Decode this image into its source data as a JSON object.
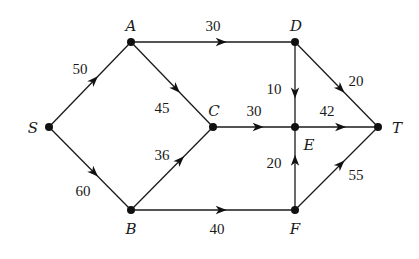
{
  "colors": {
    "ink": "#1a1a1a",
    "background": "#ffffff"
  },
  "nodes": [
    {
      "id": "S",
      "label": "S",
      "x": 49,
      "y": 127,
      "lx": 33,
      "ly": 133,
      "anchor": "middle"
    },
    {
      "id": "A",
      "label": "A",
      "x": 131,
      "y": 42,
      "lx": 131,
      "ly": 31,
      "anchor": "middle"
    },
    {
      "id": "B",
      "label": "B",
      "x": 131,
      "y": 210,
      "lx": 131,
      "ly": 234,
      "anchor": "middle"
    },
    {
      "id": "C",
      "label": "C",
      "x": 213,
      "y": 127,
      "lx": 214,
      "ly": 116,
      "anchor": "middle"
    },
    {
      "id": "D",
      "label": "D",
      "x": 295,
      "y": 42,
      "lx": 296,
      "ly": 31,
      "anchor": "middle"
    },
    {
      "id": "E",
      "label": "E",
      "x": 295,
      "y": 127,
      "lx": 309,
      "ly": 150,
      "anchor": "middle"
    },
    {
      "id": "F",
      "label": "F",
      "x": 295,
      "y": 210,
      "lx": 295,
      "ly": 234,
      "anchor": "middle"
    },
    {
      "id": "T",
      "label": "T",
      "x": 378,
      "y": 127,
      "lx": 397,
      "ly": 133,
      "anchor": "middle"
    }
  ],
  "edges": [
    {
      "from": "S",
      "to": "A",
      "weight": "50",
      "lx": 80,
      "ly": 74,
      "t": 0.55
    },
    {
      "from": "S",
      "to": "B",
      "weight": "60",
      "lx": 83,
      "ly": 196,
      "t": 0.55
    },
    {
      "from": "A",
      "to": "D",
      "weight": "30",
      "lx": 213,
      "ly": 31,
      "t": 0.55
    },
    {
      "from": "A",
      "to": "C",
      "weight": "45",
      "lx": 162,
      "ly": 113,
      "t": 0.55
    },
    {
      "from": "B",
      "to": "C",
      "weight": "36",
      "lx": 162,
      "ly": 160,
      "t": 0.6
    },
    {
      "from": "B",
      "to": "F",
      "weight": "40",
      "lx": 217,
      "ly": 234,
      "t": 0.55
    },
    {
      "from": "C",
      "to": "E",
      "weight": "30",
      "lx": 254,
      "ly": 116,
      "t": 0.55
    },
    {
      "from": "D",
      "to": "E",
      "weight": "10",
      "lx": 274,
      "ly": 94,
      "t": 0.6
    },
    {
      "from": "D",
      "to": "T",
      "weight": "20",
      "lx": 356,
      "ly": 86,
      "t": 0.55
    },
    {
      "from": "E",
      "to": "T",
      "weight": "42",
      "lx": 327,
      "ly": 116,
      "t": 0.55
    },
    {
      "from": "F",
      "to": "E",
      "weight": "20",
      "lx": 274,
      "ly": 168,
      "t": 0.6
    },
    {
      "from": "F",
      "to": "T",
      "weight": "55",
      "lx": 356,
      "ly": 180,
      "t": 0.55
    }
  ]
}
